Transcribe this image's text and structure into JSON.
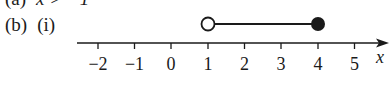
{
  "part_a": {
    "label": "(a)",
    "expression": "x > −1"
  },
  "part_b": {
    "label": "(b)",
    "sub_label": "(i)"
  },
  "number_line": {
    "variable": "x",
    "ticks": [
      "−2",
      "−1",
      "0",
      "1",
      "2",
      "3",
      "4",
      "5"
    ],
    "interval": {
      "start": 1,
      "start_type": "open",
      "end": 4,
      "end_type": "closed"
    },
    "colors": {
      "ink": "#1a1a1a",
      "background": "#ffffff"
    }
  }
}
